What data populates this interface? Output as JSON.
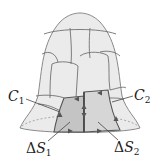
{
  "figure": {
    "labels": {
      "c1": {
        "symbol": "C",
        "subscript": "1"
      },
      "c2": {
        "symbol": "C",
        "subscript": "2"
      },
      "ds1": {
        "prefix": "Δ",
        "symbol": "S",
        "subscript": "1"
      },
      "ds2": {
        "prefix": "Δ",
        "symbol": "S",
        "subscript": "2"
      }
    },
    "colors": {
      "surface_fill": "#ebebeb",
      "patch_line": "#707070",
      "shaded_patch_1": "#c4c4c4",
      "shaded_patch_2": "#d6d6d6",
      "boundary_dark": "#555555",
      "leader_line": "#444444"
    }
  }
}
